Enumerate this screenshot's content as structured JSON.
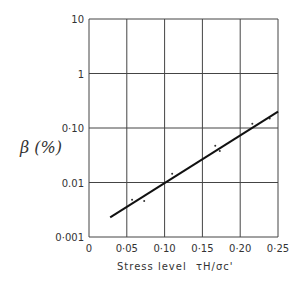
{
  "chart_data": {
    "type": "scatter",
    "title": "",
    "xlabel": "Stress level τH/σc'",
    "xlabel_text": "Stress level",
    "xlabel_symbol": "τH/σc'",
    "ylabel": "β (%)",
    "xlim": [
      0,
      0.25
    ],
    "ylim": [
      0.001,
      10
    ],
    "yscale": "log",
    "grid": true,
    "x_ticks": [
      "0",
      "0·05",
      "0·10",
      "0·15",
      "0·20",
      "0·25"
    ],
    "y_ticks": [
      "10",
      "1",
      "0·10",
      "0.01",
      "0·001"
    ],
    "series": [
      {
        "name": "measured",
        "type": "scatter",
        "points": [
          [
            0.057,
            0.0048
          ],
          [
            0.073,
            0.0046
          ],
          [
            0.11,
            0.0145
          ],
          [
            0.167,
            0.047
          ],
          [
            0.173,
            0.038
          ],
          [
            0.216,
            0.12
          ],
          [
            0.239,
            0.15
          ]
        ]
      },
      {
        "name": "fit",
        "type": "line",
        "points": [
          [
            0.028,
            0.0023
          ],
          [
            0.25,
            0.2
          ]
        ]
      }
    ]
  }
}
